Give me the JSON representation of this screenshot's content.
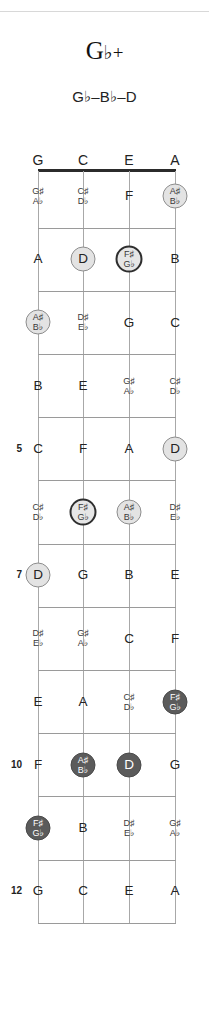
{
  "title": {
    "root": "G",
    "accidental": "♭",
    "quality": "+"
  },
  "subtitle": "G♭–B♭–D",
  "instrument": {
    "name": "ukulele",
    "tuning": [
      "G",
      "C",
      "E",
      "A"
    ]
  },
  "fretboard": {
    "string_headers": [
      "G",
      "C",
      "E",
      "A"
    ],
    "fret_numbers_shown": [
      "5",
      "7",
      "10",
      "12"
    ],
    "first_fret": 1,
    "last_fret": 12,
    "marker_styles": {
      "none": "plain text, no disc",
      "light": "light gray disc with gray ring",
      "root-light": "light disc with thick dark ring",
      "dark": "dark gray disc with white text"
    },
    "colors": {
      "nut": "#2b2b2b",
      "fret_line": "#9a9a9a",
      "string_line": "#a8a8a8",
      "light_disc": "#e3e3e3",
      "dark_disc": "#5b5b5b",
      "text": "#232323"
    },
    "frets": [
      {
        "fret": 1,
        "number_label": "",
        "notes": [
          {
            "string": "G",
            "label": "G♯/A♭",
            "top": "G♯",
            "bottom": "A♭",
            "style": "none"
          },
          {
            "string": "C",
            "label": "C♯/D♭",
            "top": "C♯",
            "bottom": "D♭",
            "style": "none"
          },
          {
            "string": "E",
            "label": "F",
            "style": "none"
          },
          {
            "string": "A",
            "label": "A♯/B♭",
            "top": "A♯",
            "bottom": "B♭",
            "style": "light"
          }
        ]
      },
      {
        "fret": 2,
        "number_label": "",
        "notes": [
          {
            "string": "G",
            "label": "A",
            "style": "none"
          },
          {
            "string": "C",
            "label": "D",
            "style": "light"
          },
          {
            "string": "E",
            "label": "F♯/G♭",
            "top": "F♯",
            "bottom": "G♭",
            "style": "root-light"
          },
          {
            "string": "A",
            "label": "B",
            "style": "none"
          }
        ]
      },
      {
        "fret": 3,
        "number_label": "",
        "notes": [
          {
            "string": "G",
            "label": "A♯/B♭",
            "top": "A♯",
            "bottom": "B♭",
            "style": "light"
          },
          {
            "string": "C",
            "label": "D♯/E♭",
            "top": "D♯",
            "bottom": "E♭",
            "style": "none"
          },
          {
            "string": "E",
            "label": "G",
            "style": "none"
          },
          {
            "string": "A",
            "label": "C",
            "style": "none"
          }
        ]
      },
      {
        "fret": 4,
        "number_label": "",
        "notes": [
          {
            "string": "G",
            "label": "B",
            "style": "none"
          },
          {
            "string": "C",
            "label": "E",
            "style": "none"
          },
          {
            "string": "E",
            "label": "G♯/A♭",
            "top": "G♯",
            "bottom": "A♭",
            "style": "none"
          },
          {
            "string": "A",
            "label": "C♯/D♭",
            "top": "C♯",
            "bottom": "D♭",
            "style": "none"
          }
        ]
      },
      {
        "fret": 5,
        "number_label": "5",
        "notes": [
          {
            "string": "G",
            "label": "C",
            "style": "none"
          },
          {
            "string": "C",
            "label": "F",
            "style": "none"
          },
          {
            "string": "E",
            "label": "A",
            "style": "none"
          },
          {
            "string": "A",
            "label": "D",
            "style": "light"
          }
        ]
      },
      {
        "fret": 6,
        "number_label": "",
        "notes": [
          {
            "string": "G",
            "label": "C♯/D♭",
            "top": "C♯",
            "bottom": "D♭",
            "style": "none"
          },
          {
            "string": "C",
            "label": "F♯/G♭",
            "top": "F♯",
            "bottom": "G♭",
            "style": "root-light"
          },
          {
            "string": "E",
            "label": "A♯/B♭",
            "top": "A♯",
            "bottom": "B♭",
            "style": "light"
          },
          {
            "string": "A",
            "label": "D♯/E♭",
            "top": "D♯",
            "bottom": "E♭",
            "style": "none"
          }
        ]
      },
      {
        "fret": 7,
        "number_label": "7",
        "notes": [
          {
            "string": "G",
            "label": "D",
            "style": "light"
          },
          {
            "string": "C",
            "label": "G",
            "style": "none"
          },
          {
            "string": "E",
            "label": "B",
            "style": "none"
          },
          {
            "string": "A",
            "label": "E",
            "style": "none"
          }
        ]
      },
      {
        "fret": 8,
        "number_label": "",
        "notes": [
          {
            "string": "G",
            "label": "D♯/E♭",
            "top": "D♯",
            "bottom": "E♭",
            "style": "none"
          },
          {
            "string": "C",
            "label": "G♯/A♭",
            "top": "G♯",
            "bottom": "A♭",
            "style": "none"
          },
          {
            "string": "E",
            "label": "C",
            "style": "none"
          },
          {
            "string": "A",
            "label": "F",
            "style": "none"
          }
        ]
      },
      {
        "fret": 9,
        "number_label": "",
        "notes": [
          {
            "string": "G",
            "label": "E",
            "style": "none"
          },
          {
            "string": "C",
            "label": "A",
            "style": "none"
          },
          {
            "string": "E",
            "label": "C♯/D♭",
            "top": "C♯",
            "bottom": "D♭",
            "style": "none"
          },
          {
            "string": "A",
            "label": "F♯/G♭",
            "top": "F♯",
            "bottom": "G♭",
            "style": "dark"
          }
        ]
      },
      {
        "fret": 10,
        "number_label": "10",
        "notes": [
          {
            "string": "G",
            "label": "F",
            "style": "none"
          },
          {
            "string": "C",
            "label": "A♯/B♭",
            "top": "A♯",
            "bottom": "B♭",
            "style": "dark"
          },
          {
            "string": "E",
            "label": "D",
            "style": "dark"
          },
          {
            "string": "A",
            "label": "G",
            "style": "none"
          }
        ]
      },
      {
        "fret": 11,
        "number_label": "",
        "notes": [
          {
            "string": "G",
            "label": "F♯/G♭",
            "top": "F♯",
            "bottom": "G♭",
            "style": "dark"
          },
          {
            "string": "C",
            "label": "B",
            "style": "none"
          },
          {
            "string": "E",
            "label": "D♯/E♭",
            "top": "D♯",
            "bottom": "E♭",
            "style": "none"
          },
          {
            "string": "A",
            "label": "G♯/A♭",
            "top": "G♯",
            "bottom": "A♭",
            "style": "none"
          }
        ]
      },
      {
        "fret": 12,
        "number_label": "12",
        "notes": [
          {
            "string": "G",
            "label": "G",
            "style": "none"
          },
          {
            "string": "C",
            "label": "C",
            "style": "none"
          },
          {
            "string": "E",
            "label": "E",
            "style": "none"
          },
          {
            "string": "A",
            "label": "A",
            "style": "none"
          }
        ]
      }
    ]
  }
}
